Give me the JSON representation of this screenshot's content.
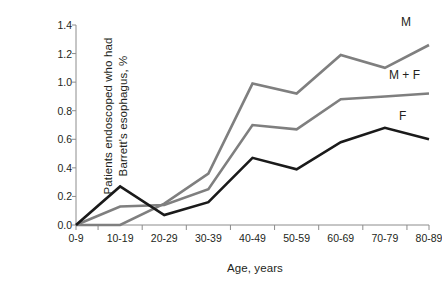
{
  "chart_data": {
    "type": "line",
    "title": "",
    "xlabel": "Age, years",
    "ylabel": "Patients endoscoped who had Barrett's esophagus, %",
    "ylabel_line1": "Patients endoscoped who had",
    "ylabel_line2": "Barrett's esophagus, %",
    "categories": [
      "0-9",
      "10-19",
      "20-29",
      "30-39",
      "40-49",
      "50-59",
      "60-69",
      "70-79",
      "80-89"
    ],
    "ylim": [
      0.0,
      1.4
    ],
    "ytick_labels": [
      "0.0",
      "0.2",
      "0.4",
      "0.6",
      "0.8",
      "1.0",
      "1.2",
      "1.4"
    ],
    "ytick_values": [
      0.0,
      0.2,
      0.4,
      0.6,
      0.8,
      1.0,
      1.2,
      1.4
    ],
    "grid": false,
    "legend_position": "inline-right-of-lines",
    "series": [
      {
        "name": "M",
        "label": "M",
        "color": "#7f7f7f",
        "values": [
          0.0,
          0.0,
          0.15,
          0.36,
          0.99,
          0.92,
          1.19,
          1.1,
          1.26
        ]
      },
      {
        "name": "M + F",
        "label": "M + F",
        "color": "#7f7f7f",
        "values": [
          0.0,
          0.13,
          0.14,
          0.25,
          0.7,
          0.67,
          0.88,
          0.9,
          0.92
        ]
      },
      {
        "name": "F",
        "label": "F",
        "color": "#1a1a1a",
        "values": [
          0.0,
          0.27,
          0.07,
          0.16,
          0.47,
          0.39,
          0.58,
          0.68,
          0.6
        ]
      }
    ]
  },
  "axis": {
    "axis_color": "#8c8c8c",
    "text_color": "#231f20"
  }
}
